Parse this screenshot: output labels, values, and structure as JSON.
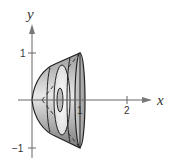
{
  "figure": {
    "axes": {
      "x_label": "x",
      "y_label": "y",
      "x_ticks": [
        {
          "value": 1,
          "label": "1"
        },
        {
          "value": 2,
          "label": "2"
        }
      ],
      "y_ticks": [
        {
          "value": 1,
          "label": "1"
        },
        {
          "value": -1,
          "label": "−1"
        }
      ]
    },
    "colors": {
      "solid_fill_dark": "#8a8a8a",
      "solid_fill_light": "#e6e6e6",
      "outline": "#222222",
      "axis": "#555555"
    }
  }
}
